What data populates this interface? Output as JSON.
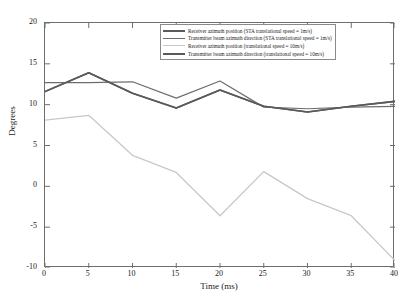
{
  "chart_data": {
    "type": "line",
    "title": "",
    "xlabel": "Time (ms)",
    "ylabel": "Degrees",
    "xlim": [
      0,
      40
    ],
    "ylim": [
      -10,
      20
    ],
    "xticks": [
      0,
      5,
      10,
      15,
      20,
      25,
      30,
      35,
      40
    ],
    "yticks": [
      20,
      15,
      10,
      5,
      0,
      -5,
      -10
    ],
    "grid": false,
    "legend_position": "top-center",
    "x": [
      0,
      5,
      10,
      15,
      20,
      25,
      30,
      35,
      40
    ],
    "series": [
      {
        "name": "Receiver azimuth position (STA translational speed = 1m/s)",
        "color": "#5a5a5a",
        "width": 1.6,
        "values": [
          11.6,
          13.9,
          11.4,
          9.6,
          11.8,
          9.8,
          9.1,
          9.8,
          10.4
        ]
      },
      {
        "name": "Transmitter beam azimuth direction (STA translational speed = 1m/s)",
        "color": "#6d6d6d",
        "width": 1.2,
        "values": [
          12.7,
          12.7,
          12.8,
          10.8,
          12.9,
          9.7,
          9.5,
          9.7,
          9.8
        ]
      },
      {
        "name": "Receiver azimuth position (translational speed = 10m/s)",
        "color": "#c8c8c8",
        "width": 1.3,
        "values": [
          8.1,
          8.7,
          3.8,
          1.7,
          -3.6,
          1.8,
          -1.5,
          -3.6,
          -9.1
        ]
      },
      {
        "name": "Transmitter beam azimuth direction (translational speed = 10m/s)",
        "color": "#5a5a5a",
        "width": 1.6,
        "values": [
          11.6,
          13.9,
          11.4,
          9.6,
          11.8,
          9.8,
          9.1,
          9.8,
          10.4
        ]
      }
    ]
  },
  "axes": {
    "x_label": "Time (ms)",
    "y_label": "Degrees",
    "x_tick_labels": [
      "0",
      "5",
      "10",
      "15",
      "20",
      "25",
      "30",
      "35",
      "40"
    ],
    "y_tick_labels": [
      "20",
      "15",
      "10",
      "5",
      "0",
      "-5",
      "-10"
    ]
  },
  "legend": {
    "entries": [
      {
        "label": "Receiver azimuth position (STA translational speed = 1m/s)",
        "color": "#5a5a5a",
        "width": 2
      },
      {
        "label": "Transmitter beam azimuth direction (STA translational speed = 1m/s)",
        "color": "#6d6d6d",
        "width": 1.2
      },
      {
        "label": "Receiver azimuth position (translational speed = 10m/s)",
        "color": "#c8c8c8",
        "width": 1.2
      },
      {
        "label": "Transmitter beam azimuth direction (translational speed = 10m/s)",
        "color": "#5a5a5a",
        "width": 2
      }
    ]
  },
  "colors": {
    "axis": "#6e6e6e",
    "text": "#1a1a1a",
    "background": "#ffffff"
  }
}
